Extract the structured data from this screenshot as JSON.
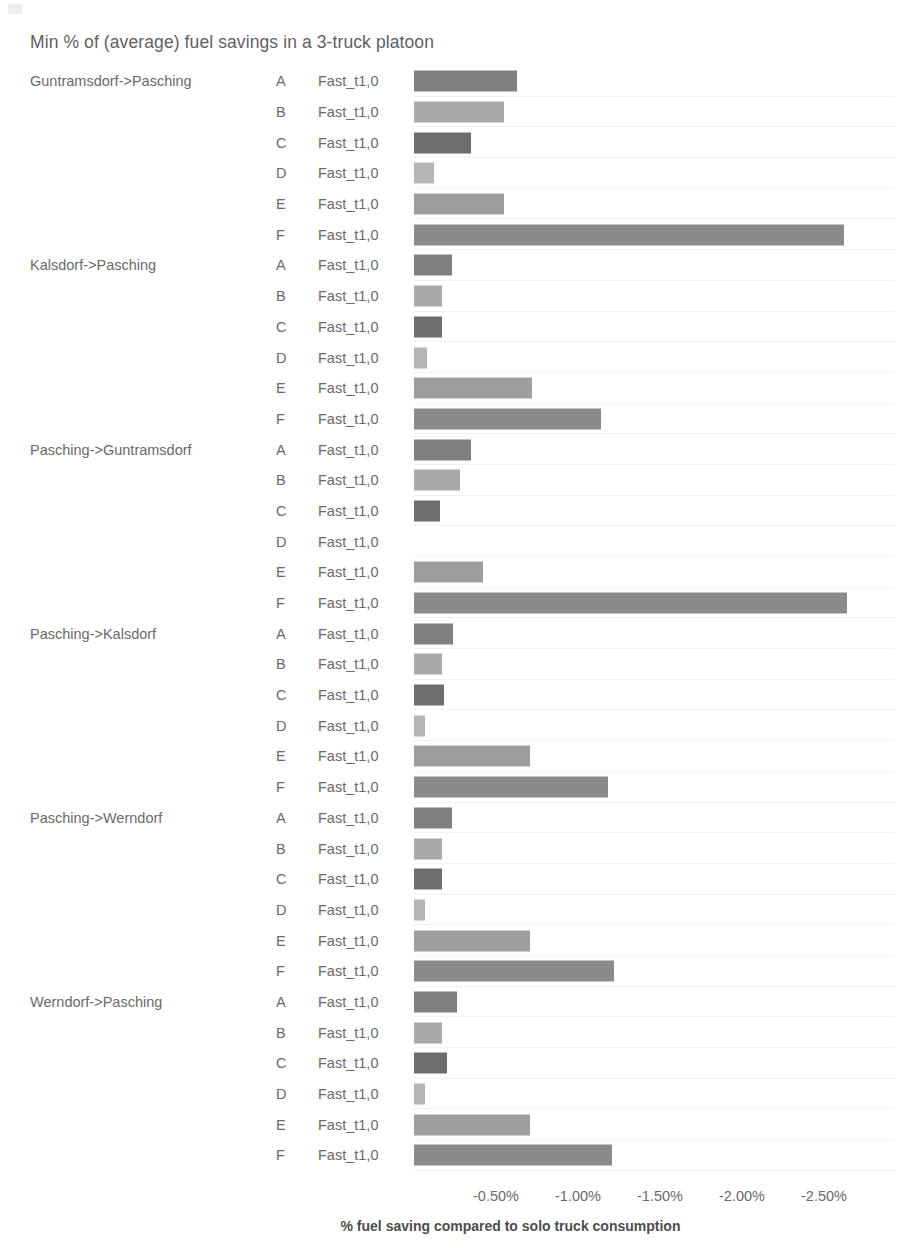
{
  "chart_data": {
    "type": "bar",
    "orientation": "horizontal",
    "title": "Min % of (average) fuel savings in a 3-truck platoon",
    "xlabel": "% fuel saving compared to solo truck consumption",
    "ylabel": "",
    "series_label": "Fast_t1,0",
    "xlim": [
      0,
      -2.75
    ],
    "xticks": [
      -0.5,
      -1.0,
      -1.5,
      -2.0,
      -2.5
    ],
    "xticklabels": [
      "-0.50%",
      "-1.00%",
      "-1.50%",
      "-2.00%",
      "-2.50%"
    ],
    "grid": false,
    "legend": "none",
    "category_letters": [
      "A",
      "B",
      "C",
      "D",
      "E",
      "F"
    ],
    "bar_colors": {
      "A": "#7f7f7f",
      "B": "#a9a9a9",
      "C": "#6d6d6d",
      "D": "#b5b5b5",
      "E": "#9e9e9e",
      "F": "#8a8a8a"
    },
    "groups": [
      {
        "route": "Guntramsdorf->Pasching",
        "bars": [
          {
            "letter": "A",
            "series": "Fast_t1,0",
            "value": -0.63
          },
          {
            "letter": "B",
            "series": "Fast_t1,0",
            "value": -0.55
          },
          {
            "letter": "C",
            "series": "Fast_t1,0",
            "value": -0.35
          },
          {
            "letter": "D",
            "series": "Fast_t1,0",
            "value": -0.12
          },
          {
            "letter": "E",
            "series": "Fast_t1,0",
            "value": -0.55
          },
          {
            "letter": "F",
            "series": "Fast_t1,0",
            "value": -2.62
          }
        ]
      },
      {
        "route": "Kalsdorf->Pasching",
        "bars": [
          {
            "letter": "A",
            "series": "Fast_t1,0",
            "value": -0.23
          },
          {
            "letter": "B",
            "series": "Fast_t1,0",
            "value": -0.17
          },
          {
            "letter": "C",
            "series": "Fast_t1,0",
            "value": -0.17
          },
          {
            "letter": "D",
            "series": "Fast_t1,0",
            "value": -0.08
          },
          {
            "letter": "E",
            "series": "Fast_t1,0",
            "value": -0.72
          },
          {
            "letter": "F",
            "series": "Fast_t1,0",
            "value": -1.14
          }
        ]
      },
      {
        "route": "Pasching->Guntramsdorf",
        "bars": [
          {
            "letter": "A",
            "series": "Fast_t1,0",
            "value": -0.35
          },
          {
            "letter": "B",
            "series": "Fast_t1,0",
            "value": -0.28
          },
          {
            "letter": "C",
            "series": "Fast_t1,0",
            "value": -0.16
          },
          {
            "letter": "D",
            "series": "Fast_t1,0",
            "value": 0.0
          },
          {
            "letter": "E",
            "series": "Fast_t1,0",
            "value": -0.42
          },
          {
            "letter": "F",
            "series": "Fast_t1,0",
            "value": -2.64
          }
        ]
      },
      {
        "route": "Pasching->Kalsdorf",
        "bars": [
          {
            "letter": "A",
            "series": "Fast_t1,0",
            "value": -0.24
          },
          {
            "letter": "B",
            "series": "Fast_t1,0",
            "value": -0.17
          },
          {
            "letter": "C",
            "series": "Fast_t1,0",
            "value": -0.18
          },
          {
            "letter": "D",
            "series": "Fast_t1,0",
            "value": -0.07
          },
          {
            "letter": "E",
            "series": "Fast_t1,0",
            "value": -0.71
          },
          {
            "letter": "F",
            "series": "Fast_t1,0",
            "value": -1.18
          }
        ]
      },
      {
        "route": "Pasching->Werndorf",
        "bars": [
          {
            "letter": "A",
            "series": "Fast_t1,0",
            "value": -0.23
          },
          {
            "letter": "B",
            "series": "Fast_t1,0",
            "value": -0.17
          },
          {
            "letter": "C",
            "series": "Fast_t1,0",
            "value": -0.17
          },
          {
            "letter": "D",
            "series": "Fast_t1,0",
            "value": -0.07
          },
          {
            "letter": "E",
            "series": "Fast_t1,0",
            "value": -0.71
          },
          {
            "letter": "F",
            "series": "Fast_t1,0",
            "value": -1.22
          }
        ]
      },
      {
        "route": "Werndorf->Pasching",
        "bars": [
          {
            "letter": "A",
            "series": "Fast_t1,0",
            "value": -0.26
          },
          {
            "letter": "B",
            "series": "Fast_t1,0",
            "value": -0.17
          },
          {
            "letter": "C",
            "series": "Fast_t1,0",
            "value": -0.2
          },
          {
            "letter": "D",
            "series": "Fast_t1,0",
            "value": -0.07
          },
          {
            "letter": "E",
            "series": "Fast_t1,0",
            "value": -0.71
          },
          {
            "letter": "F",
            "series": "Fast_t1,0",
            "value": -1.21
          }
        ]
      }
    ]
  }
}
